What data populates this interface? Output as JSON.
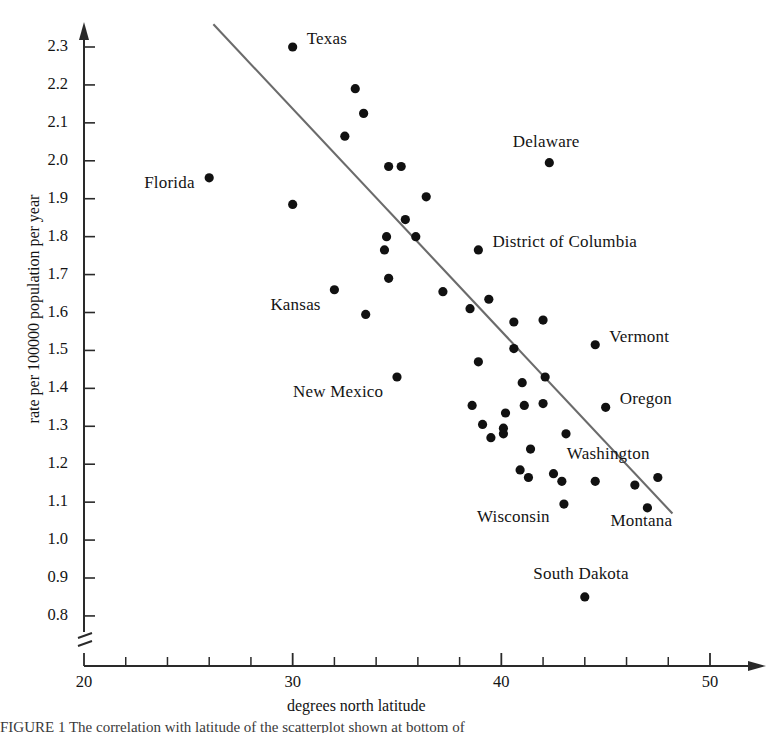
{
  "chart_data": {
    "type": "scatter",
    "title": "",
    "xlabel": "degrees north latitude",
    "ylabel": "rate per 100000 population per year",
    "xlim": [
      20,
      50
    ],
    "ylim": [
      0.8,
      2.3
    ],
    "y_axis_break": true,
    "grid": false,
    "legend": "none",
    "x_ticks_major": [
      20,
      30,
      40,
      50
    ],
    "x_ticks_minor": [
      22,
      24,
      26,
      28,
      32,
      34,
      36,
      38,
      42,
      44,
      46,
      48
    ],
    "y_ticks": [
      0.8,
      0.9,
      1.0,
      1.1,
      1.2,
      1.3,
      1.4,
      1.5,
      1.6,
      1.7,
      1.8,
      1.9,
      2.0,
      2.1,
      2.2,
      2.3
    ],
    "marker_color": "#111111",
    "line_color": "#6b6b6b",
    "trend_line": {
      "x1": 26.2,
      "y1": 2.36,
      "x2": 48.2,
      "y2": 1.07
    },
    "points": [
      {
        "x": 30.0,
        "y": 2.3,
        "label": "Texas"
      },
      {
        "x": 26.0,
        "y": 1.955,
        "label": "Florida"
      },
      {
        "x": 42.3,
        "y": 1.995,
        "label": "Delaware"
      },
      {
        "x": 38.9,
        "y": 1.765,
        "label": "District of Columbia"
      },
      {
        "x": 32.0,
        "y": 1.66,
        "label": "Kansas"
      },
      {
        "x": 35.0,
        "y": 1.43,
        "label": "New Mexico"
      },
      {
        "x": 44.5,
        "y": 1.515,
        "label": "Vermont"
      },
      {
        "x": 45.0,
        "y": 1.35,
        "label": "Oregon"
      },
      {
        "x": 47.5,
        "y": 1.165,
        "label": "Washington"
      },
      {
        "x": 47.0,
        "y": 1.085,
        "label": "Montana"
      },
      {
        "x": 43.0,
        "y": 1.095,
        "label": "Wisconsin"
      },
      {
        "x": 44.0,
        "y": 0.85,
        "label": "South Dakota"
      },
      {
        "x": 33.0,
        "y": 2.19,
        "label": ""
      },
      {
        "x": 33.4,
        "y": 2.125,
        "label": ""
      },
      {
        "x": 32.5,
        "y": 2.065,
        "label": ""
      },
      {
        "x": 34.6,
        "y": 1.985,
        "label": ""
      },
      {
        "x": 35.2,
        "y": 1.985,
        "label": ""
      },
      {
        "x": 36.4,
        "y": 1.905,
        "label": ""
      },
      {
        "x": 30.0,
        "y": 1.885,
        "label": ""
      },
      {
        "x": 35.4,
        "y": 1.845,
        "label": ""
      },
      {
        "x": 34.5,
        "y": 1.8,
        "label": ""
      },
      {
        "x": 35.9,
        "y": 1.8,
        "label": ""
      },
      {
        "x": 34.4,
        "y": 1.765,
        "label": ""
      },
      {
        "x": 34.6,
        "y": 1.69,
        "label": ""
      },
      {
        "x": 37.2,
        "y": 1.655,
        "label": ""
      },
      {
        "x": 33.5,
        "y": 1.595,
        "label": ""
      },
      {
        "x": 39.4,
        "y": 1.635,
        "label": ""
      },
      {
        "x": 38.5,
        "y": 1.61,
        "label": ""
      },
      {
        "x": 40.6,
        "y": 1.575,
        "label": ""
      },
      {
        "x": 42.0,
        "y": 1.58,
        "label": ""
      },
      {
        "x": 40.6,
        "y": 1.505,
        "label": ""
      },
      {
        "x": 38.9,
        "y": 1.47,
        "label": ""
      },
      {
        "x": 41.0,
        "y": 1.415,
        "label": ""
      },
      {
        "x": 42.1,
        "y": 1.43,
        "label": ""
      },
      {
        "x": 38.6,
        "y": 1.355,
        "label": ""
      },
      {
        "x": 41.1,
        "y": 1.355,
        "label": ""
      },
      {
        "x": 42.0,
        "y": 1.36,
        "label": ""
      },
      {
        "x": 40.2,
        "y": 1.335,
        "label": ""
      },
      {
        "x": 39.1,
        "y": 1.305,
        "label": ""
      },
      {
        "x": 40.1,
        "y": 1.295,
        "label": ""
      },
      {
        "x": 40.1,
        "y": 1.28,
        "label": ""
      },
      {
        "x": 43.1,
        "y": 1.28,
        "label": ""
      },
      {
        "x": 39.5,
        "y": 1.27,
        "label": ""
      },
      {
        "x": 41.4,
        "y": 1.24,
        "label": ""
      },
      {
        "x": 40.9,
        "y": 1.185,
        "label": ""
      },
      {
        "x": 41.3,
        "y": 1.165,
        "label": ""
      },
      {
        "x": 42.5,
        "y": 1.175,
        "label": ""
      },
      {
        "x": 42.9,
        "y": 1.155,
        "label": ""
      },
      {
        "x": 44.5,
        "y": 1.155,
        "label": ""
      },
      {
        "x": 46.4,
        "y": 1.145,
        "label": ""
      }
    ]
  },
  "labels": {
    "texas": "Texas",
    "florida": "Florida",
    "delaware": "Delaware",
    "dc": "District of Columbia",
    "kansas": "Kansas",
    "new_mexico": "New Mexico",
    "vermont": "Vermont",
    "oregon": "Oregon",
    "washington": "Washington",
    "montana": "Montana",
    "wisconsin": "Wisconsin",
    "south_dakota": "South Dakota"
  },
  "axis": {
    "x_title": "degrees north latitude",
    "y_title": "rate per 100000 population per year"
  },
  "caption": "FIGURE 1   The correlation with latitude of the scatterplot shown at bottom of"
}
